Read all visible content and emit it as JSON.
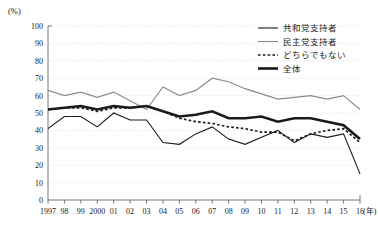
{
  "chart_data": {
    "type": "line",
    "title": "",
    "xlabel": "年",
    "ylabel": "(%)",
    "ylim": [
      0,
      100
    ],
    "ytick_step": 10,
    "grid": true,
    "legend_position": "top-right",
    "x": [
      "1997",
      "98",
      "99",
      "2000",
      "01",
      "02",
      "03",
      "04",
      "05",
      "06",
      "07",
      "08",
      "09",
      "10",
      "11",
      "12",
      "13",
      "14",
      "15",
      "16"
    ],
    "ytick_labels": [
      "0",
      "10",
      "20",
      "30",
      "40",
      "50",
      "60",
      "70",
      "80",
      "90",
      "100"
    ],
    "series": [
      {
        "name": "共和党支持者",
        "style": "solid-thin",
        "color": "#1a1a1a",
        "values": [
          41,
          48,
          48,
          42,
          50,
          46,
          46,
          33,
          32,
          38,
          42,
          35,
          32,
          36,
          40,
          33,
          38,
          36,
          38,
          15
        ]
      },
      {
        "name": "民主党支持者",
        "style": "solid-gray",
        "color": "#8a8a8a",
        "values": [
          63,
          60,
          62,
          59,
          62,
          57,
          52,
          65,
          60,
          63,
          70,
          68,
          64,
          61,
          58,
          59,
          60,
          58,
          60,
          52
        ]
      },
      {
        "name": "どちらでもない",
        "style": "dotted",
        "color": "#1a1a1a",
        "values": [
          52,
          53,
          53,
          51,
          53,
          53,
          54,
          51,
          47,
          45,
          44,
          42,
          41,
          39,
          39,
          34,
          38,
          40,
          41,
          33
        ]
      },
      {
        "name": "全体",
        "style": "solid-bold",
        "color": "#1a1a1a",
        "values": [
          52,
          53,
          54,
          52,
          54,
          53,
          54,
          51,
          48,
          49,
          51,
          47,
          47,
          48,
          45,
          47,
          47,
          45,
          43,
          35
        ]
      }
    ],
    "legend": [
      {
        "label": "共和党支持者",
        "style": "solid-thin",
        "color": "#1a1a1a"
      },
      {
        "label": "民主党支持者",
        "style": "solid-gray",
        "color": "#8a8a8a"
      },
      {
        "label": "どちらでもない",
        "style": "dotted",
        "color": "#1a1a1a"
      },
      {
        "label": "全体",
        "style": "solid-bold",
        "color": "#1a1a1a"
      }
    ]
  }
}
